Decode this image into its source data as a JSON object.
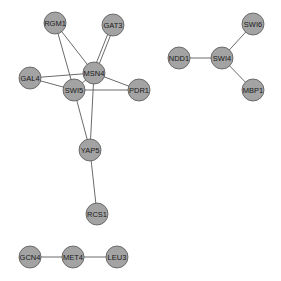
{
  "diagram": {
    "type": "network",
    "node_fill": "#a3a3a3",
    "node_stroke": "#555555",
    "edge_color": "#6b6b6b",
    "node_radius": 11,
    "nodes": [
      {
        "id": "RGM1",
        "label": "RGM1",
        "x": 55,
        "y": 23
      },
      {
        "id": "GAT3",
        "label": "GAT3",
        "x": 113,
        "y": 25
      },
      {
        "id": "MSN4",
        "label": "MSN4",
        "x": 94,
        "y": 73
      },
      {
        "id": "GAL4",
        "label": "GAL4",
        "x": 30,
        "y": 78
      },
      {
        "id": "SWI5",
        "label": "SWI5",
        "x": 74,
        "y": 90
      },
      {
        "id": "PDR1",
        "label": "PDR1",
        "x": 139,
        "y": 90
      },
      {
        "id": "YAP5",
        "label": "YAP5",
        "x": 90,
        "y": 150
      },
      {
        "id": "RCS1",
        "label": "RCS1",
        "x": 97,
        "y": 214
      },
      {
        "id": "NDD1",
        "label": "NDD1",
        "x": 179,
        "y": 58
      },
      {
        "id": "SWI4",
        "label": "SWI4",
        "x": 222,
        "y": 58
      },
      {
        "id": "SWI6",
        "label": "SWI6",
        "x": 253,
        "y": 24
      },
      {
        "id": "MBP1",
        "label": "MBP1",
        "x": 253,
        "y": 90
      },
      {
        "id": "GCN4",
        "label": "GCN4",
        "x": 30,
        "y": 257
      },
      {
        "id": "MET4",
        "label": "MET4",
        "x": 73,
        "y": 257
      },
      {
        "id": "LEU3",
        "label": "LEU3",
        "x": 117,
        "y": 257
      }
    ],
    "edges": [
      {
        "source": "RGM1",
        "target": "MSN4"
      },
      {
        "source": "RGM1",
        "target": "SWI5"
      },
      {
        "source": "GAT3",
        "target": "MSN4",
        "offset": -1.5
      },
      {
        "source": "GAT3",
        "target": "MSN4",
        "offset": 1.5
      },
      {
        "source": "GAL4",
        "target": "MSN4"
      },
      {
        "source": "GAL4",
        "target": "SWI5"
      },
      {
        "source": "SWI5",
        "target": "MSN4"
      },
      {
        "source": "SWI5",
        "target": "PDR1"
      },
      {
        "source": "MSN4",
        "target": "PDR1"
      },
      {
        "source": "SWI5",
        "target": "YAP5"
      },
      {
        "source": "MSN4",
        "target": "YAP5"
      },
      {
        "source": "YAP5",
        "target": "RCS1"
      },
      {
        "source": "NDD1",
        "target": "SWI4"
      },
      {
        "source": "SWI4",
        "target": "SWI6"
      },
      {
        "source": "SWI4",
        "target": "MBP1"
      },
      {
        "source": "GCN4",
        "target": "MET4"
      },
      {
        "source": "MET4",
        "target": "LEU3"
      }
    ]
  }
}
